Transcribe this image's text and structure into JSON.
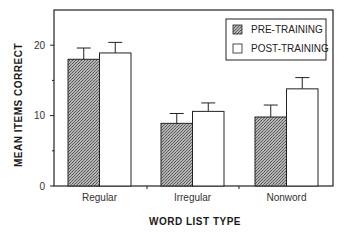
{
  "chart_data": {
    "type": "bar",
    "title": "",
    "xlabel": "WORD LIST TYPE",
    "ylabel": "MEAN ITEMS CORRECT",
    "categories": [
      "Regular",
      "Irregular",
      "Nonword"
    ],
    "series": [
      {
        "name": "PRE-TRAINING",
        "values": [
          18.0,
          8.9,
          9.8
        ],
        "error": [
          1.6,
          1.4,
          1.7
        ],
        "fill": "#9a9a9a",
        "pattern": "stippled"
      },
      {
        "name": "POST-TRAINING",
        "values": [
          18.9,
          10.6,
          13.8
        ],
        "error": [
          1.5,
          1.2,
          1.6
        ],
        "fill": "#ffffff",
        "pattern": "none"
      }
    ],
    "ylim": [
      0,
      25
    ],
    "yticks": [
      0,
      10,
      20
    ],
    "yticks_minor": [
      5,
      15
    ],
    "grid": false,
    "legend_position": "upper right",
    "error_bars": "upper only"
  }
}
